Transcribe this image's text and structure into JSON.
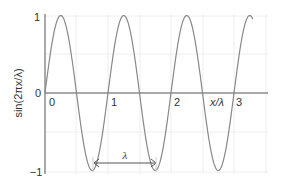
{
  "chart_data": {
    "type": "line",
    "title": "",
    "xlabel": "x/λ",
    "ylabel": "sin(2πx/λ)",
    "xlim": [
      0,
      3.3
    ],
    "ylim": [
      -1,
      1
    ],
    "x_ticks": [
      "0",
      "1",
      "2",
      "3"
    ],
    "y_ticks": [
      "1",
      "0",
      "−1"
    ],
    "grid": true,
    "series": [
      {
        "name": "sin(2πx/λ)",
        "x": [
          0,
          0.25,
          0.5,
          0.75,
          1,
          1.25,
          1.5,
          1.75,
          2,
          2.25,
          2.5,
          2.75,
          3,
          3.25,
          3.3
        ],
        "values": [
          0,
          1,
          0,
          -1,
          0,
          1,
          0,
          -1,
          0,
          1,
          0,
          -1,
          0,
          1,
          0.95
        ],
        "color": "#888888"
      }
    ],
    "annotations": [
      {
        "type": "double-arrow",
        "from_x": 0.75,
        "to_x": 1.75,
        "y": -0.85,
        "label": "λ"
      }
    ]
  },
  "labels": {
    "y_axis": "sin(2πx/λ)",
    "x_axis": "x/λ",
    "y_tick_top": "1",
    "y_tick_mid": "0",
    "y_tick_bottom": "−1",
    "x_tick_0": "0",
    "x_tick_1": "1",
    "x_tick_2": "2",
    "x_tick_3": "3",
    "wavelength": "λ"
  }
}
